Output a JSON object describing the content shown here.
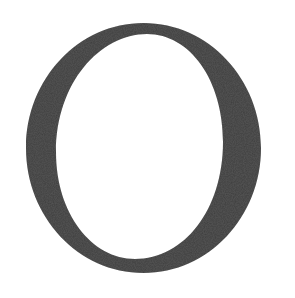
{
  "glyph": {
    "character": "O",
    "color": "#3d3d3d",
    "background": "#ffffff"
  }
}
